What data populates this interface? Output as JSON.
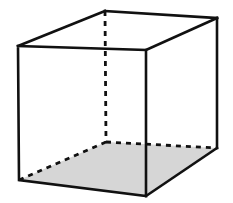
{
  "figure": {
    "shape_type": "cuboid",
    "projection": "oblique-perspective",
    "background_color": "#ffffff",
    "edge_color": "#111111",
    "edge_width_px": 2.6,
    "hidden_edge_style": "dashed",
    "hidden_edge_dash_pattern": "5 5",
    "shaded_face_name": "base",
    "shaded_face_color": "#d6d6d6",
    "canvas": {
      "width": 233,
      "height": 203
    }
  },
  "vertices": {
    "front_top_left": {
      "label": "A",
      "x": 18,
      "y": 46,
      "visible": true
    },
    "front_top_right": {
      "label": "B",
      "x": 146,
      "y": 50,
      "visible": true
    },
    "front_bottom_right": {
      "label": "C",
      "x": 146,
      "y": 196,
      "visible": true
    },
    "front_bottom_left": {
      "label": "D",
      "x": 19,
      "y": 180,
      "visible": true
    },
    "back_top_left": {
      "label": "E",
      "x": 105,
      "y": 11,
      "visible": true
    },
    "back_top_right": {
      "label": "F",
      "x": 217,
      "y": 18,
      "visible": true
    },
    "back_bottom_right": {
      "label": "G",
      "x": 217,
      "y": 148,
      "visible": true
    },
    "back_bottom_left": {
      "label": "H",
      "x": 106,
      "y": 142,
      "visible": false
    }
  },
  "paths": {
    "base_face_fill": "19,180 106,142 217,148 146,196",
    "front_face": "18,46 146,50 146,196 19,180 18,46",
    "top_face_left_edge": "18,46 105,11",
    "top_face_back_edge": "105,11 217,18",
    "top_face_right_edge": "146,50 217,18",
    "right_face_back_vertical": "217,18 217,148",
    "right_face_bottom_edge": "217,148 146,196",
    "hidden_vertical_edge": "105,11 106,142",
    "hidden_base_left_edge": "19,180 106,142",
    "hidden_base_back_edge": "106,142 217,148"
  },
  "labels": {
    "visible_text": []
  }
}
